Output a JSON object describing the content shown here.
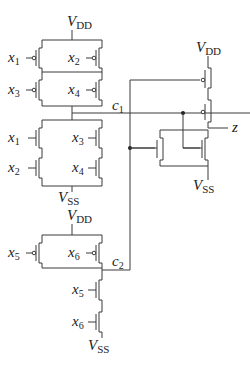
{
  "diagram": {
    "type": "CMOS transistor-level circuit",
    "supply_labels": {
      "vdd": {
        "main": "V",
        "sub": "DD"
      },
      "vss": {
        "main": "V",
        "sub": "SS"
      }
    },
    "gate1": {
      "pullup_inputs": [
        {
          "main": "x",
          "sub": "1"
        },
        {
          "main": "x",
          "sub": "2"
        },
        {
          "main": "x",
          "sub": "3"
        },
        {
          "main": "x",
          "sub": "4"
        }
      ],
      "pulldown_inputs": [
        {
          "main": "x",
          "sub": "1"
        },
        {
          "main": "x",
          "sub": "2"
        },
        {
          "main": "x",
          "sub": "3"
        },
        {
          "main": "x",
          "sub": "4"
        }
      ],
      "output": {
        "main": "c",
        "sub": "1"
      }
    },
    "gate2": {
      "pullup_inputs": [
        {
          "main": "x",
          "sub": "5"
        },
        {
          "main": "x",
          "sub": "6"
        }
      ],
      "pulldown_inputs": [
        {
          "main": "x",
          "sub": "5"
        },
        {
          "main": "x",
          "sub": "6"
        }
      ],
      "output": {
        "main": "c",
        "sub": "2"
      }
    },
    "gate3": {
      "inputs": [
        {
          "main": "c",
          "sub": "1"
        },
        {
          "main": "c",
          "sub": "2"
        }
      ],
      "output": {
        "main": "z",
        "sub": ""
      }
    }
  }
}
